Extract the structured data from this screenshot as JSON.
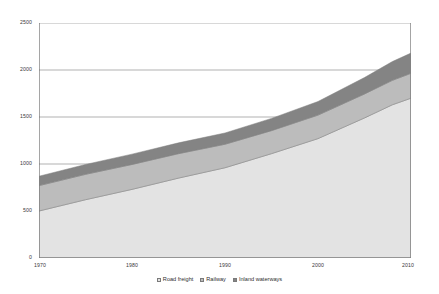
{
  "chart_data": {
    "type": "area",
    "stacked": true,
    "title": "",
    "subtitle": "",
    "xlabel": "",
    "ylabel": "",
    "xlim": [
      1970,
      2010
    ],
    "ylim": [
      0,
      2500
    ],
    "x_tick_labels": [
      "1970",
      "1980",
      "1990",
      "2000",
      "2010"
    ],
    "x_ticks": [
      1970,
      1980,
      1990,
      2000,
      2010
    ],
    "y_tick_labels": [
      "0",
      "500",
      "1000",
      "1500",
      "2000",
      "2500"
    ],
    "y_ticks": [
      0,
      500,
      1000,
      1500,
      2000,
      2500
    ],
    "grid": "horizontal",
    "legend_position": "bottom-center",
    "x": [
      1970,
      1975,
      1980,
      1985,
      1990,
      1995,
      2000,
      2005,
      2008,
      2010
    ],
    "series": [
      {
        "name": "Road freight",
        "color": "#e3e3e3",
        "values": [
          500,
          620,
          730,
          850,
          960,
          1110,
          1270,
          1490,
          1630,
          1700
        ]
      },
      {
        "name": "Railway",
        "color": "#bcbcbc",
        "values": [
          270,
          270,
          265,
          260,
          250,
          245,
          250,
          255,
          260,
          265
        ]
      },
      {
        "name": "Inland waterways",
        "color": "#848484",
        "values": [
          100,
          105,
          110,
          115,
          120,
          130,
          145,
          175,
          200,
          215
        ]
      }
    ],
    "cumulative_totals": [
      870,
      995,
      1105,
      1225,
      1330,
      1485,
      1665,
      1920,
      2090,
      2180
    ],
    "axis_color": "#808080",
    "grid_color": "#909090",
    "text_color": "#3a3a3a"
  },
  "legend": {
    "items": [
      {
        "label": "Road freight",
        "swatch": "#e3e3e3"
      },
      {
        "label": "Railway",
        "swatch": "#bcbcbc"
      },
      {
        "label": "Inland waterways",
        "swatch": "#848484"
      }
    ]
  }
}
